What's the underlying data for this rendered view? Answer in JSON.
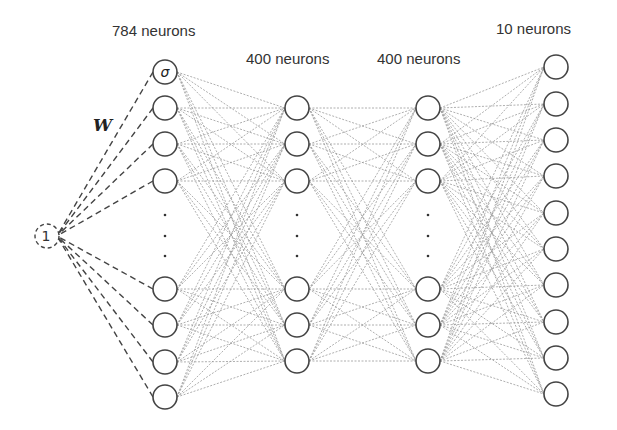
{
  "title": "",
  "colors": {
    "node_stroke": "#444444",
    "edge": "#9a9a9a",
    "bias_edge": "#444444",
    "text": "#333333",
    "background": "#ffffff"
  },
  "bias": {
    "label": "1",
    "x": 47,
    "y": 236,
    "r": 12,
    "weight_label": "W"
  },
  "layers": [
    {
      "name": "input",
      "label": "784 neurons",
      "label_pos": [
        112,
        22
      ],
      "x": 165,
      "nodes_y": [
        72,
        108,
        144,
        181,
        289,
        325,
        362,
        397
      ],
      "first_node_symbol": "σ",
      "ellipsis_y": [
        215,
        236,
        256
      ]
    },
    {
      "name": "hidden1",
      "label": "400 neurons",
      "label_pos": [
        246,
        50
      ],
      "x": 297,
      "nodes_y": [
        108,
        144,
        181,
        289,
        325,
        361
      ],
      "ellipsis_y": [
        215,
        236,
        256
      ]
    },
    {
      "name": "hidden2",
      "label": "400 neurons",
      "label_pos": [
        377,
        50
      ],
      "x": 428,
      "nodes_y": [
        108,
        144,
        181,
        289,
        325,
        361
      ],
      "ellipsis_y": [
        215,
        236,
        256
      ]
    },
    {
      "name": "output",
      "label": "10 neurons",
      "label_pos": [
        496,
        20
      ],
      "x": 556,
      "nodes_y": [
        67,
        104,
        140,
        176,
        213,
        249,
        285,
        322,
        358,
        394
      ],
      "ellipsis_y": []
    }
  ],
  "node_radius": 12
}
